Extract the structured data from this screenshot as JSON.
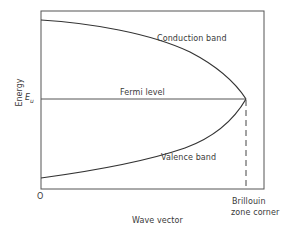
{
  "diagram": {
    "type": "energy-band-diagram",
    "y_axis_label": "Energy",
    "x_axis_label": "Wave vector",
    "origin_label": "O",
    "fermi_energy_symbol": "E",
    "fermi_energy_subscript": "u",
    "labels": {
      "conduction_band": "Conduction band",
      "fermi_level": "Fermi level",
      "valence_band": "Valence band",
      "brillouin_line1": "Brillouin",
      "brillouin_line2": "zone corner"
    },
    "colors": {
      "line": "#333333",
      "text": "#3a3a3a",
      "background": "#ffffff"
    }
  }
}
